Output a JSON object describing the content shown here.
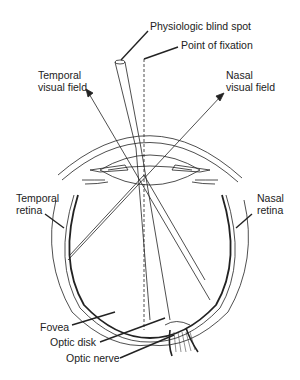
{
  "diagram": {
    "labels": {
      "blind_spot": "Physiologic blind spot",
      "fixation": "Point of fixation",
      "temporal_field_1": "Temporal",
      "temporal_field_2": "visual field",
      "nasal_field_1": "Nasal",
      "nasal_field_2": "visual field",
      "temporal_retina_1": "Temporal",
      "temporal_retina_2": "retina",
      "nasal_retina_1": "Nasal",
      "nasal_retina_2": "retina",
      "fovea": "Fovea",
      "optic_disk": "Optic disk",
      "optic_nerve": "Optic nerve"
    },
    "colors": {
      "ink": "#222222",
      "background": "#ffffff"
    }
  }
}
